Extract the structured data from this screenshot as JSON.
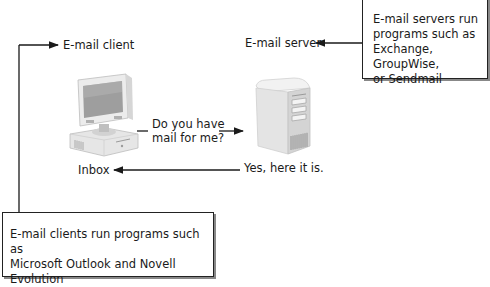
{
  "diagram": {
    "nodes": {
      "client": {
        "label": "E-mail client",
        "icon": "desktop-computer-icon"
      },
      "server": {
        "label": "E-mail server",
        "icon": "tower-server-icon"
      },
      "inbox": {
        "label": "Inbox"
      }
    },
    "messages": {
      "request_line1": "Do you have",
      "request_line2": "mail for me?",
      "response": "Yes, here it is."
    },
    "callouts": {
      "server_note": {
        "lines": [
          "E-mail servers run",
          "programs such as",
          "Exchange, GroupWise,",
          "or Sendmail"
        ]
      },
      "client_note": {
        "lines": [
          "E-mail clients run programs such as",
          "Microsoft Outlook and Novell Evolution"
        ]
      }
    },
    "colors": {
      "line": "#1a1a1a",
      "icon_light": "#eeeeee",
      "icon_mid": "#c8c8c8",
      "icon_dark": "#8a8a8a"
    }
  }
}
